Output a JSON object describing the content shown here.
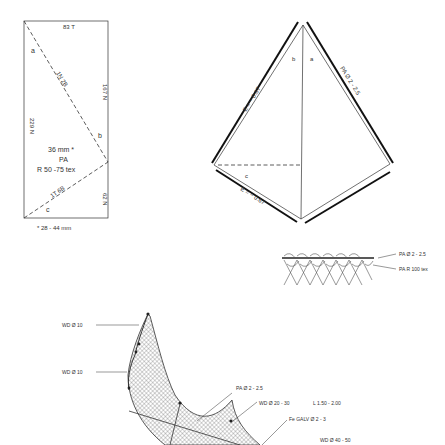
{
  "panel_rect": {
    "top_label": "83 T",
    "left_label": "229 N",
    "right_upper_label": "167 N",
    "right_lower_label": "62 N",
    "diag_upper_label": "1N 2B",
    "diag_lower_label": "1T 6B",
    "corner_a": "a",
    "corner_b": "b",
    "corner_c": "c",
    "mesh_size": "36 mm  *",
    "material": "PA",
    "twine": "R 50 -75 tex",
    "footnote": "*  28 - 44 mm"
  },
  "panel_kite": {
    "upper_left_label": "E = ~ 0.67",
    "lower_left_label": "E = ~ 0.67",
    "upper_right_label": "PA Ø 2 - 2.5",
    "corner_a": "a",
    "corner_b": "b",
    "corner_c": "c"
  },
  "selvedge_detail": {
    "rope_label": "PA  Ø  2 - 2.5",
    "twine_label": "PA  R  100  tex"
  },
  "net_assembly": {
    "labels": [
      "WD  Ø  10",
      "WD  Ø  10",
      "PA  Ø  2 - 2.5",
      "WD  Ø  20 - 30",
      "L 1.50 - 2.00",
      "Fe  GALV  Ø  2 - 3",
      "WD  Ø  40 - 50"
    ]
  }
}
